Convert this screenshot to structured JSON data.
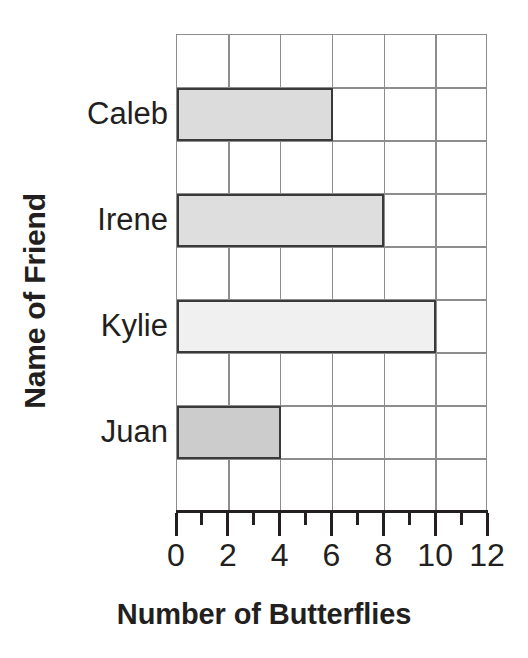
{
  "chart_data": {
    "type": "bar",
    "orientation": "horizontal",
    "title": "",
    "xlabel": "Number of Butterflies",
    "ylabel": "Name of Friend",
    "categories": [
      "Caleb",
      "Irene",
      "Kylie",
      "Juan"
    ],
    "values": [
      6,
      8,
      10,
      4
    ],
    "xlim": [
      0,
      12
    ],
    "xticks": [
      0,
      2,
      4,
      6,
      8,
      10,
      12
    ],
    "xtick_labels": [
      "0",
      "2",
      "4",
      "6",
      "8",
      "10",
      "12"
    ],
    "minor_xticks": [
      1,
      3,
      5,
      7,
      9,
      11
    ],
    "grid": true,
    "legend": null,
    "bar_colors": [
      "#dcdcdc",
      "#dedede",
      "#f0f0f0",
      "#cccccc"
    ],
    "bar_edge_color": "#3a3a3a",
    "grid_color": "#8d8d8d",
    "axis_color": "#231f20",
    "background": "#ffffff"
  }
}
